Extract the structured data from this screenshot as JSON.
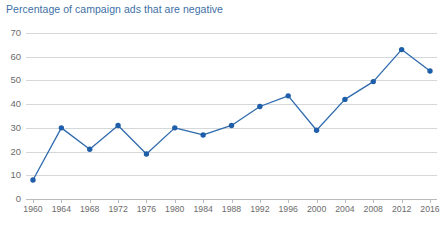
{
  "chart_data": {
    "type": "line",
    "title": "Percentage of campaign ads that are negative",
    "xlabel": "",
    "ylabel": "",
    "categories": [
      "1960",
      "1964",
      "1968",
      "1972",
      "1976",
      "1980",
      "1984",
      "1988",
      "1992",
      "1996",
      "2000",
      "2004",
      "2008",
      "2012",
      "2016"
    ],
    "x": [
      1960,
      1964,
      1968,
      1972,
      1976,
      1980,
      1984,
      1988,
      1992,
      1996,
      2000,
      2004,
      2008,
      2012,
      2016
    ],
    "values": [
      8,
      30,
      21,
      31,
      19,
      30,
      27,
      31,
      39,
      43.5,
      29,
      42,
      49.5,
      63,
      54
    ],
    "series": [
      {
        "name": "Percentage of campaign ads that are negative",
        "values": [
          8,
          30,
          21,
          31,
          19,
          30,
          27,
          31,
          39,
          43.5,
          29,
          42,
          49.5,
          63,
          54
        ]
      }
    ],
    "ylim": [
      0,
      70
    ],
    "yticks": [
      0,
      10,
      20,
      30,
      40,
      50,
      60,
      70
    ],
    "ytick_labels": [
      "0",
      "10",
      "20",
      "30",
      "40",
      "50",
      "60",
      "70"
    ],
    "grid": true,
    "legend": "none",
    "markers": true,
    "colors": {
      "line": "#2e6aad",
      "marker": "#1f5fa9",
      "title": "#3d6fa6",
      "gridline": "#d5d8db",
      "axis": "#b9bcbf",
      "tick_label": "#6b6b6b",
      "background": "#ffffff"
    }
  }
}
